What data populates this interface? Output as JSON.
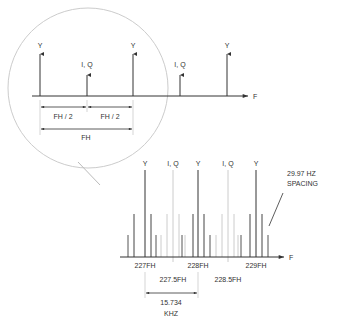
{
  "upper": {
    "components": [
      {
        "label": "Y",
        "x": 40,
        "kind": "luma"
      },
      {
        "label": "I, Q",
        "x": 87,
        "kind": "chroma"
      },
      {
        "label": "Y",
        "x": 133,
        "kind": "luma"
      },
      {
        "label": "I, Q",
        "x": 180,
        "kind": "chroma"
      },
      {
        "label": "Y",
        "x": 227,
        "kind": "luma"
      }
    ],
    "axis_label": "F",
    "dim_half_left": "FH / 2",
    "dim_half_right": "FH / 2",
    "dim_full": "FH"
  },
  "lower": {
    "main_lines": [
      {
        "label": "Y",
        "x": 145,
        "kind": "luma"
      },
      {
        "label": "I, Q",
        "x": 173,
        "kind": "chroma"
      },
      {
        "label": "Y",
        "x": 198,
        "kind": "luma"
      },
      {
        "label": "I, Q",
        "x": 228,
        "kind": "chroma"
      },
      {
        "label": "Y",
        "x": 256,
        "kind": "luma"
      }
    ],
    "axis_label": "F",
    "ticks_primary": [
      {
        "label": "227FH",
        "x": 145
      },
      {
        "label": "228FH",
        "x": 198
      },
      {
        "label": "229FH",
        "x": 256
      }
    ],
    "ticks_secondary": [
      {
        "label": "227.5FH",
        "x": 173
      },
      {
        "label": "228.5FH",
        "x": 228
      }
    ],
    "spacing_note_line1": "29.97  HZ",
    "spacing_note_line2": "SPACING",
    "dim_value": "15.734",
    "dim_unit": "KHZ"
  },
  "colors": {
    "line": "#333333",
    "chroma_line": "#bbbbbb",
    "circle": "#cccccc"
  }
}
